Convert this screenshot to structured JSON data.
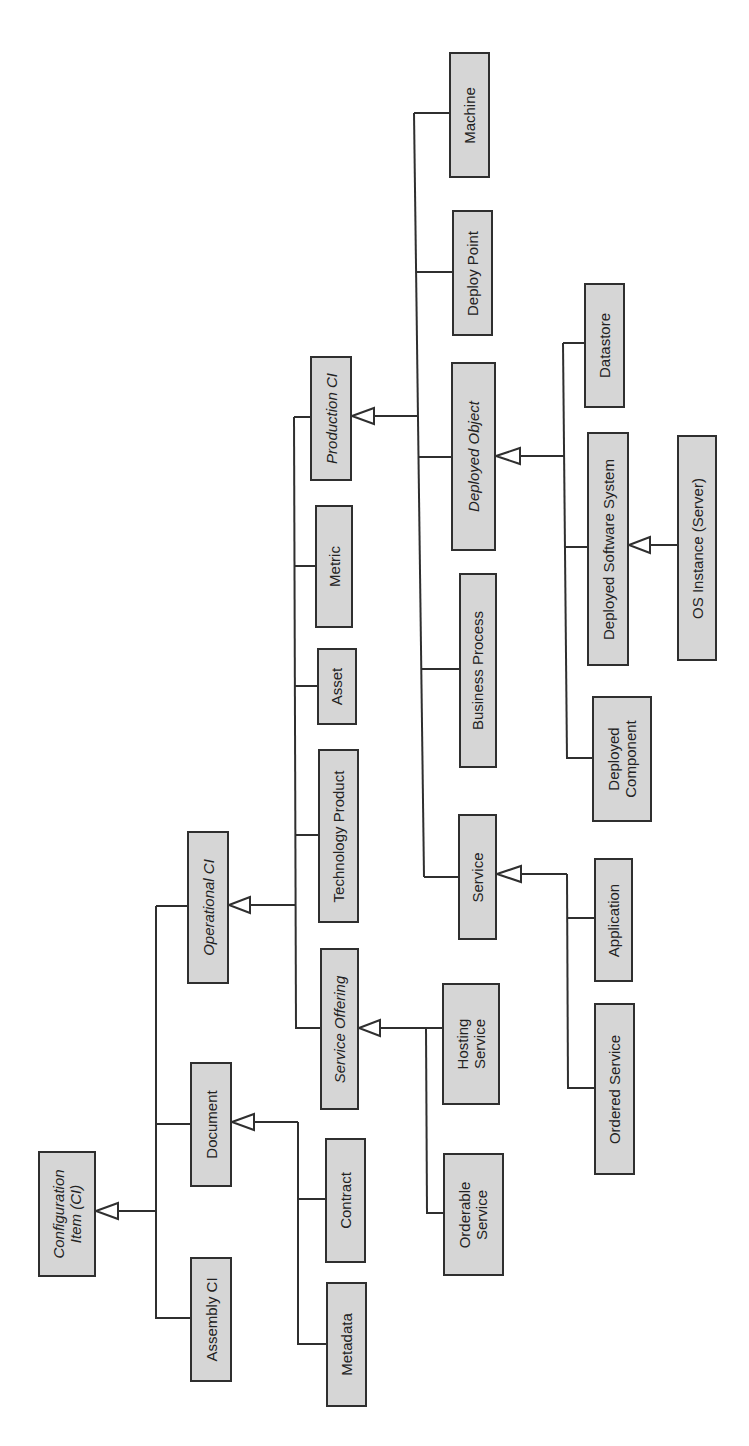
{
  "diagram": {
    "type": "class-hierarchy",
    "orientation": "rotated-90-ccw",
    "colors": {
      "box_fill": "#d6d6d6",
      "box_border": "#2f2f2f",
      "line": "#2f2f2f",
      "text": "#222222",
      "background": "#ffffff"
    },
    "nodes": {
      "configuration_item": {
        "label": "Configuration\nItem (CI)",
        "abstract": true
      },
      "assembly_ci": {
        "label": "Assembly CI",
        "abstract": false
      },
      "document": {
        "label": "Document",
        "abstract": false
      },
      "metadata": {
        "label": "Metadata",
        "abstract": false
      },
      "contract": {
        "label": "Contract",
        "abstract": false
      },
      "operational_ci": {
        "label": "Operational CI",
        "abstract": true
      },
      "service_offering": {
        "label": "Service Offering",
        "abstract": true
      },
      "orderable_service": {
        "label": "Orderable\nService",
        "abstract": false
      },
      "hosting_service": {
        "label": "Hosting\nService",
        "abstract": false
      },
      "technology_product": {
        "label": "Technology Product",
        "abstract": false
      },
      "asset": {
        "label": "Asset",
        "abstract": false
      },
      "metric": {
        "label": "Metric",
        "abstract": false
      },
      "production_ci": {
        "label": "Production CI",
        "abstract": true
      },
      "service": {
        "label": "Service",
        "abstract": false
      },
      "ordered_service": {
        "label": "Ordered Service",
        "abstract": false
      },
      "application": {
        "label": "Application",
        "abstract": false
      },
      "business_process": {
        "label": "Business Process",
        "abstract": false
      },
      "deployed_object": {
        "label": "Deployed Object",
        "abstract": true
      },
      "deployed_component": {
        "label": "Deployed\nComponent",
        "abstract": false
      },
      "deployed_software_system": {
        "label": "Deployed Software System",
        "abstract": false
      },
      "os_instance": {
        "label": "OS Instance (Server)",
        "abstract": false
      },
      "datastore": {
        "label": "Datastore",
        "abstract": false
      },
      "deploy_point": {
        "label": "Deploy Point",
        "abstract": false
      },
      "machine": {
        "label": "Machine",
        "abstract": false
      }
    },
    "edges": [
      {
        "parent": "Configuration Item (CI)",
        "children": [
          "Operational CI",
          "Document",
          "Assembly CI"
        ]
      },
      {
        "parent": "Document",
        "children": [
          "Contract",
          "Metadata"
        ]
      },
      {
        "parent": "Operational CI",
        "children": [
          "Production CI",
          "Metric",
          "Asset",
          "Technology Product",
          "Service Offering"
        ]
      },
      {
        "parent": "Service Offering",
        "children": [
          "Hosting Service",
          "Orderable Service"
        ]
      },
      {
        "parent": "Production CI",
        "children": [
          "Machine",
          "Deploy Point",
          "Deployed Object",
          "Business Process",
          "Service"
        ]
      },
      {
        "parent": "Service",
        "children": [
          "Application",
          "Ordered Service"
        ]
      },
      {
        "parent": "Deployed Object",
        "children": [
          "Datastore",
          "Deployed Software System",
          "Deployed Component"
        ]
      },
      {
        "parent": "Deployed Software System",
        "children": [
          "OS Instance (Server)"
        ]
      }
    ]
  }
}
